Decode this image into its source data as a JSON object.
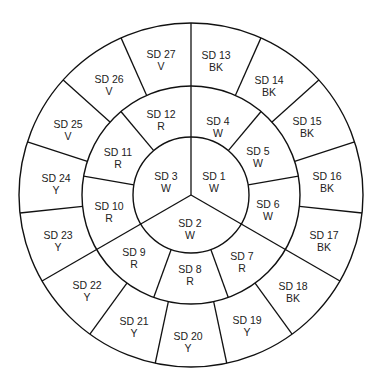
{
  "diagram": {
    "title": "",
    "geometry": {
      "center": [
        191,
        195
      ],
      "radii": {
        "inner": 58,
        "middle": 109,
        "outer": 172
      },
      "stroke_color": "#111111"
    },
    "rings": {
      "inner": {
        "segment_count": 3,
        "segments": [
          {
            "id": "SD 1",
            "code": "W",
            "pos": [
              214,
              182
            ]
          },
          {
            "id": "SD 2",
            "code": "W",
            "pos": [
              190,
              229
            ]
          },
          {
            "id": "SD 3",
            "code": "W",
            "pos": [
              166,
              182
            ]
          }
        ]
      },
      "middle": {
        "segment_count": 9,
        "segments": [
          {
            "id": "SD 4",
            "code": "W",
            "pos": [
              218,
              127
            ]
          },
          {
            "id": "SD 5",
            "code": "W",
            "pos": [
              258,
              157
            ]
          },
          {
            "id": "SD 6",
            "code": "W",
            "pos": [
              268,
              210
            ]
          },
          {
            "id": "SD 7",
            "code": "R",
            "pos": [
              242,
              262
            ]
          },
          {
            "id": "SD 8",
            "code": "R",
            "pos": [
              190,
              275
            ]
          },
          {
            "id": "SD 9",
            "code": "R",
            "pos": [
              134,
              258
            ]
          },
          {
            "id": "SD 10",
            "code": "R",
            "pos": [
              109,
              212
            ]
          },
          {
            "id": "SD 11",
            "code": "R",
            "pos": [
              118,
              158
            ]
          },
          {
            "id": "SD 12",
            "code": "R",
            "pos": [
              161,
              120
            ]
          }
        ]
      },
      "outer": {
        "segment_count": 15,
        "segments": [
          {
            "id": "SD 13",
            "code": "BK",
            "pos": [
              216,
              61
            ]
          },
          {
            "id": "SD 14",
            "code": "BK",
            "pos": [
              269,
              86
            ]
          },
          {
            "id": "SD 15",
            "code": "BK",
            "pos": [
              307,
              127
            ]
          },
          {
            "id": "SD 16",
            "code": "BK",
            "pos": [
              327,
              182
            ]
          },
          {
            "id": "SD 17",
            "code": "BK",
            "pos": [
              324,
              241
            ]
          },
          {
            "id": "SD 18",
            "code": "BK",
            "pos": [
              293,
              292
            ]
          },
          {
            "id": "SD 19",
            "code": "Y",
            "pos": [
              247,
              326
            ]
          },
          {
            "id": "SD 20",
            "code": "Y",
            "pos": [
              188,
              342
            ]
          },
          {
            "id": "SD 21",
            "code": "Y",
            "pos": [
              134,
              327
            ]
          },
          {
            "id": "SD 22",
            "code": "Y",
            "pos": [
              87,
              291
            ]
          },
          {
            "id": "SD 23",
            "code": "Y",
            "pos": [
              58,
              241
            ]
          },
          {
            "id": "SD 24",
            "code": "Y",
            "pos": [
              56,
              184
            ]
          },
          {
            "id": "SD 25",
            "code": "V",
            "pos": [
              68,
              130
            ]
          },
          {
            "id": "SD 26",
            "code": "V",
            "pos": [
              109,
              85
            ]
          },
          {
            "id": "SD 27",
            "code": "V",
            "pos": [
              161,
              60
            ]
          }
        ]
      }
    },
    "legend_codes": [
      "W",
      "R",
      "BK",
      "Y",
      "V"
    ]
  }
}
